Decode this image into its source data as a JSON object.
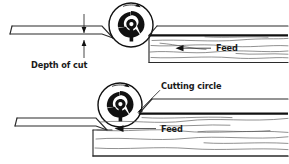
{
  "figure": {
    "background_color": "#ffffff",
    "ink_color": "#111111",
    "grain_color": "#555555",
    "width": 289,
    "height": 164
  },
  "labels": {
    "depth_of_cut": "Depth of cut",
    "cutting_circle": "Cutting circle",
    "feed_top": "Feed",
    "feed_bottom": "Feed"
  },
  "icons": {
    "cutterhead": "cutterhead-icon",
    "rotation_arrow": "rotation-arrow-icon",
    "feed_arrow": "feed-arrow-icon",
    "dimension_arrow": "dimension-arrow-icon",
    "leader_line": "leader-line-icon"
  },
  "diagrams": [
    {
      "name": "top-diagram",
      "description": "Light depth of cut - cutterhead above infeed table",
      "parts": [
        "infeed-table",
        "cutterhead",
        "outfeed-stock"
      ],
      "annotations": [
        "Depth of cut",
        "Feed"
      ]
    },
    {
      "name": "bottom-diagram",
      "description": "Heavy depth of cut - cutting circle tangent to outfeed stock",
      "parts": [
        "infeed-table",
        "cutterhead",
        "outfeed-stock"
      ],
      "annotations": [
        "Cutting circle",
        "Feed"
      ]
    }
  ]
}
